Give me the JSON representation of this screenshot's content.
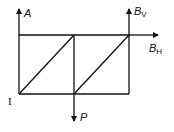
{
  "diagram": {
    "type": "truss-free-body",
    "labels": {
      "A": "A",
      "B_base": "B",
      "BV_sub": "V",
      "BH_sub": "H",
      "P": "P",
      "I": "I"
    },
    "forces": [
      {
        "name": "A",
        "direction": "up",
        "location": "left-top joint"
      },
      {
        "name": "B_V",
        "direction": "up",
        "location": "right-top joint"
      },
      {
        "name": "B_H",
        "direction": "right",
        "location": "right-top joint"
      },
      {
        "name": "P",
        "direction": "down",
        "location": "middle-bottom joint"
      }
    ],
    "members": [
      "top chord",
      "bottom chord",
      "left vertical",
      "middle vertical",
      "right vertical",
      "left diagonal",
      "right diagonal"
    ],
    "colors": {
      "stroke": "#111111",
      "background": "#ffffff"
    }
  }
}
